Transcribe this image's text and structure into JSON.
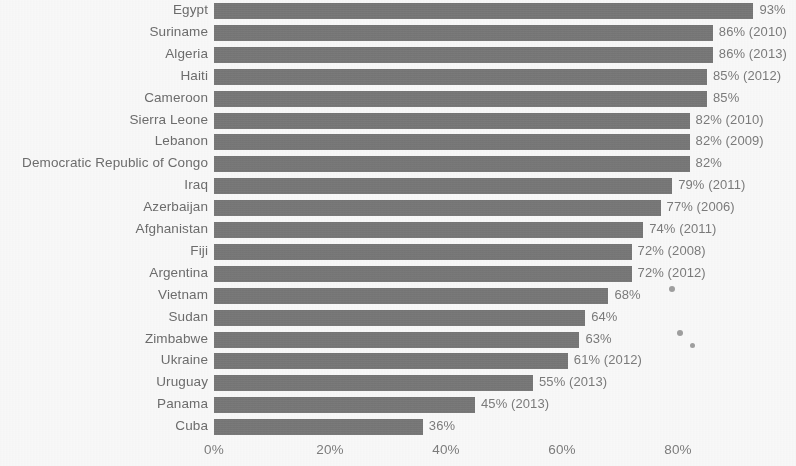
{
  "chart_data": {
    "type": "bar",
    "orientation": "horizontal",
    "title": "",
    "subtitle": "",
    "xlabel": "",
    "ylabel": "",
    "xlim": [
      0,
      93
    ],
    "axis_max_tick": 80,
    "grid": false,
    "legend": null,
    "bar_color": "#737373",
    "text_color": "#6c6c6c",
    "background_color": "#fdfdfd",
    "x_ticks": [
      "0%",
      "20%",
      "40%",
      "60%",
      "80%"
    ],
    "x_tick_values": [
      0,
      20,
      40,
      60,
      80
    ],
    "categories": [
      "Egypt",
      "Suriname",
      "Algeria",
      "Haiti",
      "Cameroon",
      "Sierra Leone",
      "Lebanon",
      "Democratic Republic of Congo",
      "Iraq",
      "Azerbaijan",
      "Afghanistan",
      "Fiji",
      "Argentina",
      "Vietnam",
      "Sudan",
      "Zimbabwe",
      "Ukraine",
      "Uruguay",
      "Panama",
      "Cuba"
    ],
    "values": [
      93,
      86,
      86,
      85,
      85,
      82,
      82,
      82,
      79,
      77,
      74,
      72,
      72,
      68,
      64,
      63,
      61,
      55,
      45,
      36
    ],
    "data_labels": [
      "93%",
      "86% (2010)",
      "86% (2013)",
      "85% (2012)",
      "85%",
      "82% (2010)",
      "82% (2009)",
      "82%",
      "79% (2011)",
      "77% (2006)",
      "74% (2011)",
      "72% (2008)",
      "72% (2012)",
      "68%",
      "64%",
      "63%",
      "61% (2012)",
      "55% (2013)",
      "45% (2013)",
      "36%"
    ],
    "years": [
      null,
      2010,
      2013,
      2012,
      null,
      2010,
      2009,
      null,
      2011,
      2006,
      2011,
      2008,
      2012,
      null,
      null,
      null,
      2012,
      2013,
      2013,
      null
    ]
  },
  "artifacts": {
    "specks": [
      {
        "x": 669,
        "y": 286,
        "size": 6
      },
      {
        "x": 677,
        "y": 330,
        "size": 6
      },
      {
        "x": 690,
        "y": 343,
        "size": 5
      }
    ]
  }
}
